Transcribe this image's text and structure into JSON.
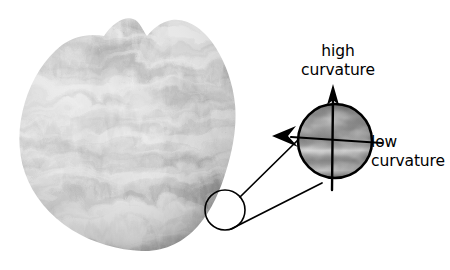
{
  "figure": {
    "name": "curvature-illustration",
    "background_color": "#ffffff",
    "width": 450,
    "height": 270,
    "stroke_color": "#000000"
  },
  "shapes": {
    "blob": {
      "name": "textured-blob",
      "description": "irregular organic blob with marbled grayscale texture"
    },
    "magnifier_circle": {
      "name": "magnified-inset-circle",
      "center_x": 335,
      "center_y": 141,
      "radius": 37
    },
    "sample_circle": {
      "name": "sample-region-circle",
      "center_x": 225,
      "center_y": 210,
      "radius": 20
    }
  },
  "annotations": {
    "high_curvature": {
      "line1": "high",
      "line2": "curvature",
      "direction": "vertical-arrow-up"
    },
    "low_curvature": {
      "line1": "low",
      "line2": "curvature",
      "direction": "horizontal-tick-right"
    }
  }
}
